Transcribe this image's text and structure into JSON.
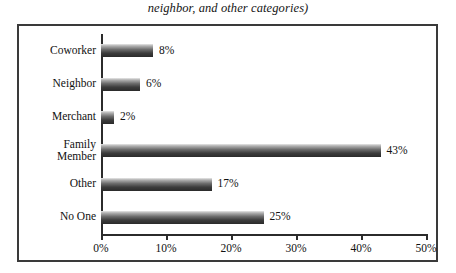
{
  "chart_data": {
    "type": "bar",
    "orientation": "horizontal",
    "title": "neighbor, and other categories)",
    "xlabel": "",
    "ylabel": "",
    "categories": [
      "Coworker",
      "Neighbor",
      "Merchant",
      "Family\nMember",
      "Other",
      "No One"
    ],
    "values": [
      8,
      6,
      2,
      43,
      17,
      25
    ],
    "value_labels": [
      "8%",
      "6%",
      "2%",
      "43%",
      "17%",
      "25%"
    ],
    "xlim": [
      0,
      50
    ],
    "xticks": [
      0,
      10,
      20,
      30,
      40,
      50
    ],
    "xtick_labels": [
      "0%",
      "10%",
      "20%",
      "30%",
      "40%",
      "50%"
    ],
    "grid": false,
    "legend": null,
    "bar_color": "#3c3c3c",
    "frame_color": "#3a3a3a",
    "background": "#ffffff"
  }
}
